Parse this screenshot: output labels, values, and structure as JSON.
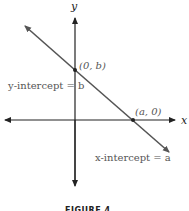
{
  "diagram": {
    "x_axis_label": "x",
    "y_axis_label": "y",
    "y_intercept_point_label": "(0, b)",
    "x_intercept_point_label": "(a, 0)",
    "y_intercept_text": "y-intercept = b",
    "x_intercept_text": "x-intercept = a",
    "caption": "FIGURE 4",
    "colors": {
      "axis": "#222222",
      "line": "#555555",
      "label": "#555555"
    }
  }
}
